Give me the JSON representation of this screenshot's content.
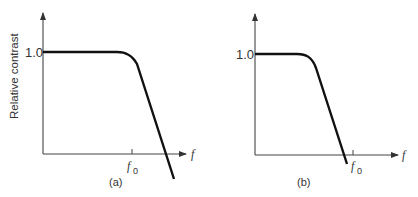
{
  "figure": {
    "panels": [
      {
        "id": "a",
        "caption": "(a)",
        "y_axis_label": "Relative contrast",
        "y_tick_label": "1.0",
        "x_axis_label": "f",
        "x_tick_label": "f",
        "x_tick_subscript": "0",
        "description": "Flat response at 1.0 until near f0, then steep linear roll-off crossing the f-axis beyond f0"
      },
      {
        "id": "b",
        "caption": "(b)",
        "y_axis_label": "",
        "y_tick_label": "1.0",
        "x_axis_label": "f",
        "x_tick_label": "f",
        "x_tick_subscript": "0",
        "description": "Flat response at 1.0 for shorter range, roll-off begins earlier, crossing f-axis just before f0"
      }
    ],
    "colors": {
      "line": "#111111",
      "axis": "#444444",
      "text": "#333333"
    }
  }
}
